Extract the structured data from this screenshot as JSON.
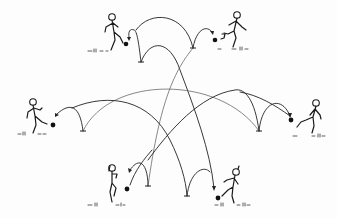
{
  "illustration": {
    "description": "Six stick-figure players arranged in a hexagon, kicking balls along arched bouncing trajectories to each other",
    "colors": {
      "background": "#fdfdfd",
      "ink": "#1a1a1a"
    },
    "players": [
      {
        "id": "top-left",
        "head": [
          112,
          17
        ],
        "ball": [
          126,
          44
        ],
        "facing": "right"
      },
      {
        "id": "top-right",
        "head": [
          237,
          15
        ],
        "ball": [
          215,
          40
        ],
        "facing": "left"
      },
      {
        "id": "middle-left",
        "head": [
          33,
          102
        ],
        "ball": [
          53,
          125
        ],
        "facing": "right"
      },
      {
        "id": "middle-right",
        "head": [
          316,
          103
        ],
        "ball": [
          291,
          120
        ],
        "facing": "left"
      },
      {
        "id": "bottom-left",
        "head": [
          112,
          168
        ],
        "ball": [
          127,
          189
        ],
        "facing": "right"
      },
      {
        "id": "bottom-right",
        "head": [
          236,
          172
        ],
        "ball": [
          218,
          198
        ],
        "facing": "left"
      }
    ],
    "bounce_points": [
      [
        141,
        62
      ],
      [
        193,
        48
      ],
      [
        83,
        131
      ],
      [
        259,
        131
      ],
      [
        148,
        186
      ],
      [
        187,
        196
      ]
    ]
  }
}
